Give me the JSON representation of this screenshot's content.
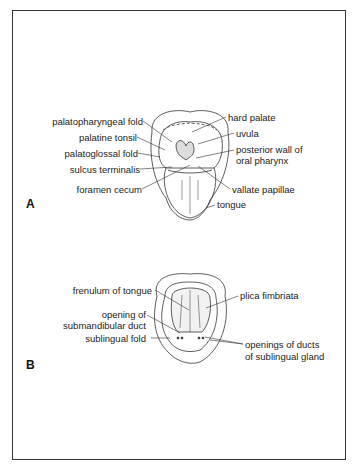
{
  "figure": {
    "panel_a": {
      "letter": "A",
      "labels": {
        "palatopharyngeal_fold": "palatopharyngeal fold",
        "palatine_tonsil": "palatine tonsil",
        "palatoglossal_fold": "palatoglossal fold",
        "sulcus_terminalis": "sulcus terminalis",
        "foramen_cecum": "foramen cecum",
        "hard_palate": "hard palate",
        "uvula": "uvula",
        "posterior_wall_1": "posterior wall of",
        "posterior_wall_2": "oral pharynx",
        "vallate_papillae": "vallate papillae",
        "tongue": "tongue"
      }
    },
    "panel_b": {
      "letter": "B",
      "labels": {
        "frenulum": "frenulum of tongue",
        "submandibular_1": "opening of",
        "submandibular_2": "submandibular duct",
        "sublingual_fold": "sublingual fold",
        "plica": "plica fimbriata",
        "ducts_1": "openings of ducts",
        "ducts_2": "of sublingual gland"
      }
    }
  }
}
